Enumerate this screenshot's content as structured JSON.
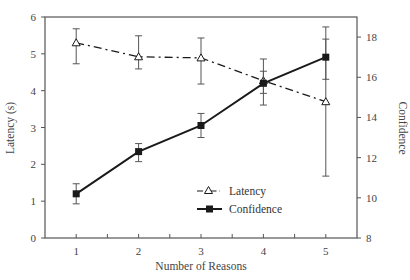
{
  "chart_data": {
    "type": "line",
    "title": "",
    "xlabel": "Number of Reasons",
    "ylabel": "Latency (s)",
    "y2label": "Confidence",
    "x": [
      1,
      2,
      3,
      4,
      5
    ],
    "xlim": [
      0.5,
      5.5
    ],
    "xticks": [
      "1",
      "2",
      "3",
      "4",
      "5"
    ],
    "ylim": [
      0,
      6
    ],
    "yticks": [
      "0",
      "1",
      "2",
      "3",
      "4",
      "5",
      "6"
    ],
    "y2lim": [
      8,
      19
    ],
    "y2ticks": [
      "8",
      "10",
      "12",
      "14",
      "16",
      "18"
    ],
    "grid": false,
    "legend_position": "lower right (inside)",
    "series": [
      {
        "name": "Latency",
        "axis": "left",
        "marker": "open-triangle",
        "linestyle": "dash-dot",
        "values": [
          5.3,
          4.92,
          4.89,
          4.27,
          3.7
        ],
        "error_low": [
          4.73,
          4.59,
          4.18,
          3.61,
          1.68
        ],
        "error_high": [
          5.68,
          5.49,
          5.43,
          4.86,
          5.73
        ]
      },
      {
        "name": "Confidence",
        "axis": "right",
        "marker": "filled-square",
        "linestyle": "solid",
        "values": [
          10.2,
          12.3,
          13.6,
          15.7,
          17.0
        ],
        "error_low": [
          9.7,
          11.8,
          13.0,
          15.2,
          15.9
        ],
        "error_high": [
          10.7,
          12.7,
          14.2,
          16.3,
          17.9
        ]
      }
    ]
  },
  "legend": {
    "items": [
      {
        "label": "Latency"
      },
      {
        "label": "Confidence"
      }
    ]
  },
  "colors": {
    "axis": "#555555",
    "line": "#1a1a1a",
    "error": "#555555"
  }
}
